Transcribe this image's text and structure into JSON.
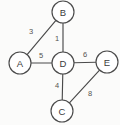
{
  "figure": {
    "background_color": "#fbfbfa",
    "stroke_color": "#4a4a4a",
    "node_fill_color": "#ffffff",
    "label_color": "#3b3b3b",
    "weight_color": "#55534f",
    "width": 120,
    "height": 125
  },
  "chart_data": {
    "type": "diagram",
    "diagram_kind": "weighted-undirected-graph",
    "title": "",
    "xlabel": "",
    "ylabel": "",
    "directed": false,
    "node_radius": 11,
    "nodes": [
      {
        "id": "A",
        "label": "A",
        "x": 20,
        "y": 63
      },
      {
        "id": "B",
        "label": "B",
        "x": 63,
        "y": 12
      },
      {
        "id": "C",
        "label": "C",
        "x": 62,
        "y": 111
      },
      {
        "id": "D",
        "label": "D",
        "x": 63,
        "y": 63
      },
      {
        "id": "E",
        "label": "E",
        "x": 107,
        "y": 62
      }
    ],
    "edges": [
      {
        "id": "A-B",
        "source": "A",
        "target": "B",
        "weight": 3,
        "label": "3",
        "label_x": 31,
        "label_y": 31
      },
      {
        "id": "B-D",
        "source": "B",
        "target": "D",
        "weight": 1,
        "label": "1",
        "label_x": 57,
        "label_y": 38
      },
      {
        "id": "A-D",
        "source": "A",
        "target": "D",
        "weight": 5,
        "label": "5",
        "label_x": 41,
        "label_y": 55
      },
      {
        "id": "D-E",
        "source": "D",
        "target": "E",
        "weight": 6,
        "label": "6",
        "label_x": 85,
        "label_y": 54
      },
      {
        "id": "D-C",
        "source": "D",
        "target": "C",
        "weight": 4,
        "label": "4",
        "label_x": 57,
        "label_y": 85
      },
      {
        "id": "C-E",
        "source": "C",
        "target": "E",
        "weight": 8,
        "label": "8",
        "label_x": 90,
        "label_y": 93
      }
    ]
  }
}
